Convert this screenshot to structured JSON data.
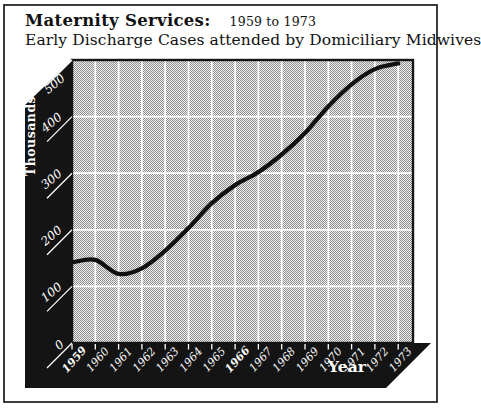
{
  "window": {
    "background": "#ffffff",
    "frame_color": "#1a1a1a"
  },
  "header": {
    "title": "Maternity Services:",
    "title_range": "1959 to 1973",
    "subtitle": "Early Discharge Cases attended by Domiciliary Midwives"
  },
  "chart_data": {
    "type": "line",
    "title": "Maternity Services: 1959 to 1973",
    "subtitle": "Early Discharge Cases attended by Domiciliary Midwives",
    "xlabel": "Year",
    "ylabel": "Thousands",
    "x": [
      "1959",
      "1960",
      "1961",
      "1962",
      "1963",
      "1964",
      "1965",
      "1966",
      "1967",
      "1968",
      "1969",
      "1970",
      "1971",
      "1972",
      "1973"
    ],
    "series": [
      {
        "name": "Early discharge cases attended by domiciliary midwives (thousands)",
        "values": [
          143,
          147,
          122,
          132,
          163,
          203,
          247,
          279,
          302,
          333,
          371,
          418,
          457,
          484,
          494
        ]
      }
    ],
    "ylim": [
      0,
      500
    ],
    "yticks": [
      0,
      100,
      200,
      300,
      400,
      500
    ],
    "grid": true,
    "legend": "none",
    "emphasized_x_labels": [
      "1959",
      "1966"
    ],
    "colors": {
      "axis_band": "#141414",
      "grid": "#ffffff",
      "line": "#111111",
      "plot_dot_dark": "#8c8c8c",
      "plot_dot_light": "#f2f2f2",
      "axis_label_text": "#ffffff",
      "title_text": "#111111"
    }
  }
}
